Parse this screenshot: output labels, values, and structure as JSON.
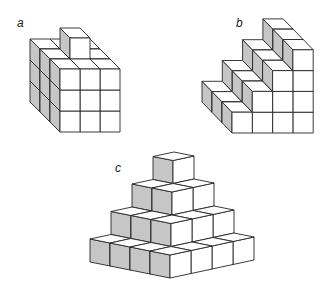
{
  "canvas": {
    "width": 332,
    "height": 290,
    "background": "#ffffff"
  },
  "style": {
    "face_light": "#ffffff",
    "face_shade": "#c6c6c6",
    "stroke": "#262626",
    "stroke_width": 0.9
  },
  "figures": [
    {
      "id": "a",
      "label": "a",
      "label_pos": [
        17,
        17
      ],
      "projection": "oblique",
      "origin": [
        60,
        132
      ],
      "axis_x": [
        20,
        0
      ],
      "axis_y": [
        0,
        -21
      ],
      "axis_z": [
        -10,
        -10
      ],
      "description": "3x3x3 block of cubes with one extra cube on top",
      "cubes": [
        [
          0,
          0,
          0
        ],
        [
          1,
          0,
          0
        ],
        [
          2,
          0,
          0
        ],
        [
          0,
          1,
          0
        ],
        [
          1,
          1,
          0
        ],
        [
          2,
          1,
          0
        ],
        [
          0,
          2,
          0
        ],
        [
          1,
          2,
          0
        ],
        [
          2,
          2,
          0
        ],
        [
          0,
          0,
          1
        ],
        [
          1,
          0,
          1
        ],
        [
          2,
          0,
          1
        ],
        [
          0,
          1,
          1
        ],
        [
          1,
          1,
          1
        ],
        [
          2,
          1,
          1
        ],
        [
          0,
          2,
          1
        ],
        [
          1,
          2,
          1
        ],
        [
          2,
          2,
          1
        ],
        [
          0,
          0,
          2
        ],
        [
          1,
          0,
          2
        ],
        [
          2,
          0,
          2
        ],
        [
          0,
          1,
          2
        ],
        [
          1,
          1,
          2
        ],
        [
          2,
          1,
          2
        ],
        [
          0,
          2,
          2
        ],
        [
          1,
          2,
          2
        ],
        [
          2,
          2,
          2
        ],
        [
          1,
          3,
          1
        ]
      ]
    },
    {
      "id": "b",
      "label": "b",
      "label_pos": [
        236,
        17
      ],
      "projection": "oblique",
      "origin": [
        232,
        133
      ],
      "axis_x": [
        20.3,
        0
      ],
      "axis_y": [
        0,
        -20.8
      ],
      "axis_z": [
        -10,
        -10.3
      ],
      "description": "Staircase: column heights 1,2,3,4 from left to right, 3 cubes deep",
      "column_heights": [
        1,
        2,
        3,
        4
      ],
      "depth": 3,
      "cubes": []
    },
    {
      "id": "c",
      "label": "c",
      "label_pos": [
        115,
        162
      ],
      "projection": "dimetric",
      "origin": [
        170,
        278
      ],
      "axis_i": [
        -20,
        -4
      ],
      "axis_j": [
        21,
        -4.5
      ],
      "axis_k": [
        0,
        -23
      ],
      "description": "Stepped pyramid: 4x4, 3x3, 2x2, 1x1 layers",
      "layers": [
        4,
        3,
        2,
        1
      ],
      "cubes": []
    }
  ]
}
